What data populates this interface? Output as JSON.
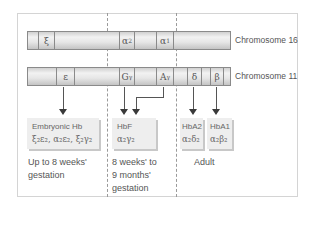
{
  "diagram": {
    "chromosomes": [
      {
        "label": "Chromosome 16",
        "genes": [
          {
            "symbol": "ξ",
            "sub": ""
          },
          {
            "symbol": "α",
            "sub": "2"
          },
          {
            "symbol": "α",
            "sub": "1"
          }
        ]
      },
      {
        "label": "Chromosome 11",
        "genes": [
          {
            "symbol": "ε",
            "sub": ""
          },
          {
            "symbol": "G",
            "sub": "γ"
          },
          {
            "symbol": "A",
            "sub": "γ"
          },
          {
            "symbol": "δ",
            "sub": ""
          },
          {
            "symbol": "β",
            "sub": ""
          }
        ]
      }
    ],
    "hemoglobins": [
      {
        "name": "Embryonic Hb",
        "formula": "ξ₂ε₂, α₂ε₂, ξ₂γ₂"
      },
      {
        "name": "HbF",
        "formula": "α₂γ₂"
      },
      {
        "name": "HbA2",
        "formula": "α₂δ₂"
      },
      {
        "name": "HbA1",
        "formula": "α₂β₂"
      }
    ],
    "stages": [
      {
        "line1": "Up to 8 weeks'",
        "line2": "gestation",
        "line3": ""
      },
      {
        "line1": "8 weeks' to",
        "line2": "9 months'",
        "line3": "gestation"
      },
      {
        "line1": "Adult",
        "line2": "",
        "line3": ""
      }
    ],
    "colors": {
      "bar_border": "#8a8a8a",
      "box_fill": "#eeeeee",
      "text": "#555555"
    }
  }
}
